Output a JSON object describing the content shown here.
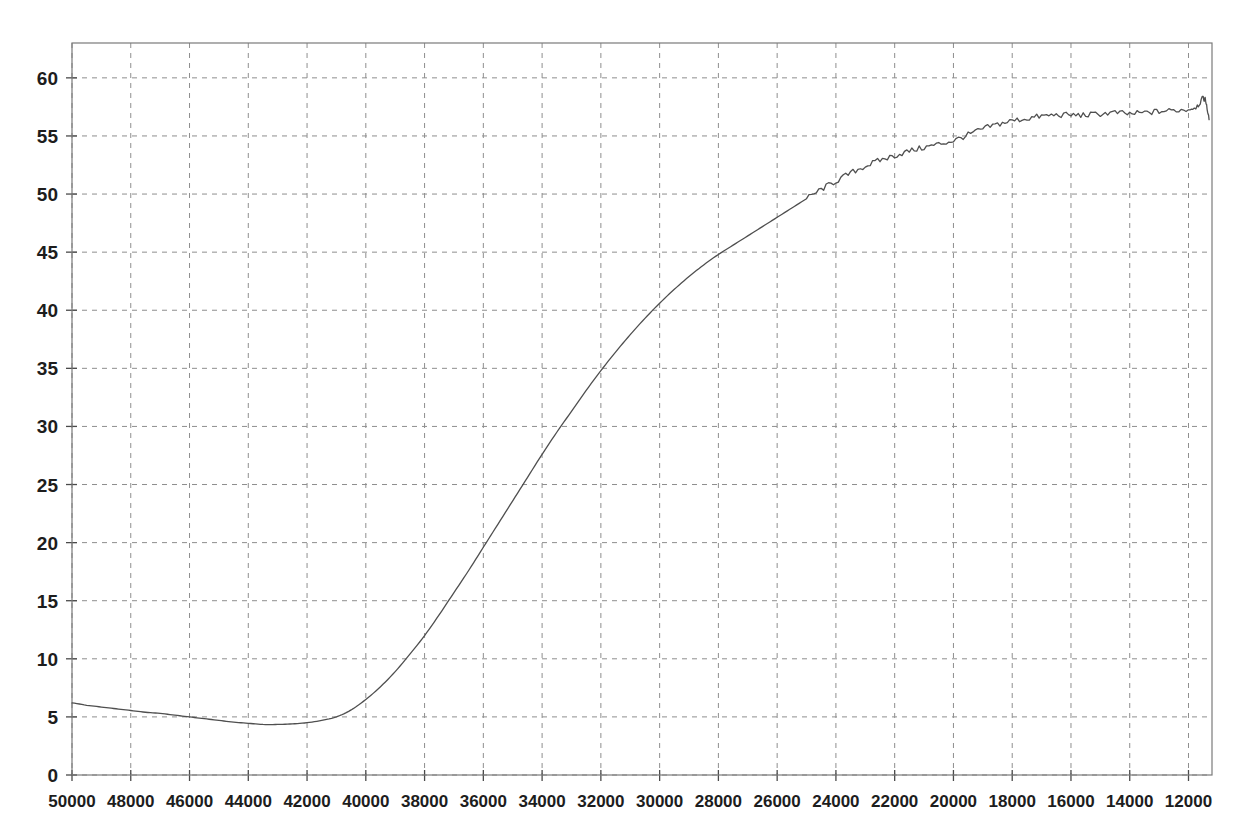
{
  "chart_data": {
    "type": "line",
    "title": "",
    "subtitle": "",
    "xlabel": "",
    "ylabel": "",
    "xlim": [
      50000,
      11200
    ],
    "ylim": [
      0,
      63
    ],
    "x_reversed": true,
    "grid": true,
    "grid_style": "dashed",
    "legend": "none",
    "x_ticks": [
      50000,
      48000,
      46000,
      44000,
      42000,
      40000,
      38000,
      36000,
      34000,
      32000,
      30000,
      28000,
      26000,
      24000,
      22000,
      20000,
      18000,
      16000,
      14000,
      12000
    ],
    "x_tick_labels": [
      "50000",
      "48000",
      "46000",
      "44000",
      "42000",
      "40000",
      "38000",
      "36000",
      "34000",
      "32000",
      "30000",
      "28000",
      "26000",
      "24000",
      "22000",
      "20000",
      "18000",
      "16000",
      "14000",
      "12000"
    ],
    "y_ticks": [
      0,
      5,
      10,
      15,
      20,
      25,
      30,
      35,
      40,
      45,
      50,
      55,
      60
    ],
    "y_tick_labels": [
      "0",
      "5",
      "10",
      "15",
      "20",
      "25",
      "30",
      "35",
      "40",
      "45",
      "50",
      "55",
      "60"
    ],
    "series": [
      {
        "name": "curve",
        "color": "#4f4f4f",
        "line_width": 1.3,
        "x": [
          50000,
          49500,
          49000,
          48500,
          48000,
          47500,
          47000,
          46500,
          46000,
          45500,
          45000,
          44500,
          44000,
          43500,
          43000,
          42500,
          42000,
          41500,
          41000,
          40500,
          40000,
          39500,
          39000,
          38500,
          38000,
          37500,
          37000,
          36500,
          36000,
          35500,
          35000,
          34500,
          34000,
          33500,
          33000,
          32500,
          32000,
          31500,
          31000,
          30500,
          30000,
          29500,
          29000,
          28500,
          28000,
          27500,
          27000,
          26500,
          26000,
          25500,
          25000,
          24500,
          24000,
          23500,
          23000,
          22500,
          22000,
          21500,
          21000,
          20500,
          20000,
          19500,
          19000,
          18500,
          18000,
          17500,
          17000,
          16500,
          16000,
          15500,
          15000,
          14500,
          14000,
          13500,
          13000,
          12500,
          12000,
          11700,
          11500,
          11400,
          11300
        ],
        "y": [
          6.2,
          6.0,
          5.85,
          5.7,
          5.55,
          5.4,
          5.3,
          5.15,
          5.0,
          4.85,
          4.7,
          4.55,
          4.45,
          4.35,
          4.35,
          4.4,
          4.5,
          4.7,
          5.0,
          5.6,
          6.5,
          7.6,
          8.9,
          10.4,
          12.0,
          13.8,
          15.7,
          17.6,
          19.6,
          21.6,
          23.6,
          25.6,
          27.6,
          29.5,
          31.3,
          33.1,
          34.8,
          36.4,
          37.9,
          39.3,
          40.6,
          41.8,
          42.9,
          43.9,
          44.8,
          45.6,
          46.4,
          47.2,
          48.0,
          48.8,
          49.6,
          50.4,
          51.1,
          51.8,
          52.4,
          52.9,
          53.3,
          53.7,
          54.0,
          54.3,
          54.6,
          55.1,
          55.6,
          56.0,
          56.3,
          56.5,
          56.7,
          56.8,
          56.8,
          56.8,
          56.9,
          57.0,
          56.9,
          57.0,
          57.1,
          57.2,
          57.3,
          57.6,
          58.2,
          57.9,
          56.4
        ],
        "noise_start_x": 25000,
        "noise_amplitude": 0.25,
        "description": "Monotone sigmoid rise from ~6 at x=50000, shallow minimum ~4.35 near x=43500, steep rise through x=38000-30000, plateau near 55-58 from x=22000 onward with small high-frequency ripple and a final spike to ~58.2 then drop to ~56.4"
      }
    ]
  },
  "axes": {
    "plot_left_px": 72,
    "plot_right_px": 1212,
    "plot_top_px": 43,
    "plot_bottom_px": 775,
    "frame_color": "#7a7a7a",
    "grid_color": "#8e8e8e",
    "tick_color": "#4a4a4a",
    "background": "#ffffff"
  }
}
